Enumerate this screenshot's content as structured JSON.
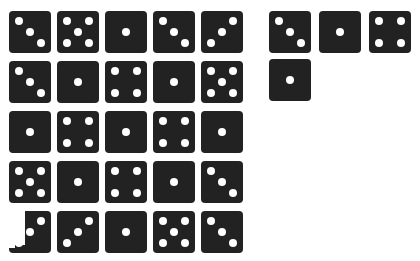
{
  "colors": {
    "die": "#222222",
    "pip": "#ffffff",
    "background": "#ffffff"
  },
  "main_grid": {
    "rows": [
      [
        3,
        5,
        1,
        3,
        3
      ],
      [
        3,
        1,
        4,
        1,
        5
      ],
      [
        1,
        4,
        1,
        4,
        1
      ],
      [
        5,
        1,
        4,
        1,
        3
      ],
      [
        3,
        3,
        1,
        5,
        3
      ]
    ],
    "orientations": [
      [
        "diag",
        "x",
        "c",
        "diag",
        "anti"
      ],
      [
        "diag",
        "c",
        "x",
        "c",
        "x"
      ],
      [
        "c",
        "x",
        "c",
        "x",
        "c"
      ],
      [
        "x",
        "c",
        "x",
        "c",
        "diag"
      ],
      [
        "anti",
        "anti",
        "c",
        "x",
        "diag"
      ]
    ]
  },
  "side_grid": {
    "rows": [
      [
        3,
        1,
        4
      ],
      [
        1
      ]
    ],
    "orientations": [
      [
        "diag",
        "c",
        "x"
      ],
      [
        "c"
      ]
    ]
  },
  "selection_marker": {
    "row": 4,
    "col": 0
  }
}
